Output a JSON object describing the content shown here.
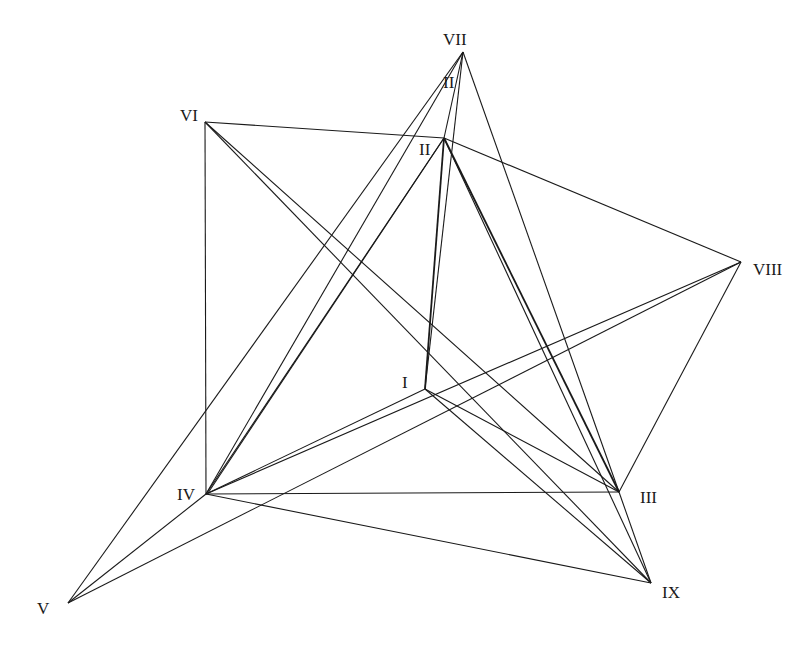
{
  "diagram": {
    "type": "line-drawing",
    "stroke_color": "#1a1a1a",
    "background": "#ffffff",
    "vertices": [
      {
        "id": "I",
        "label": "I",
        "x": 425,
        "y": 389,
        "label_x": 402,
        "label_y": 388
      },
      {
        "id": "II",
        "label": "II",
        "x": 444,
        "y": 138,
        "label_x": 419,
        "label_y": 155
      },
      {
        "id": "III",
        "label": "III",
        "x": 619,
        "y": 492,
        "label_x": 640,
        "label_y": 503
      },
      {
        "id": "IV",
        "label": "IV",
        "x": 206,
        "y": 494,
        "label_x": 177,
        "label_y": 500
      },
      {
        "id": "V",
        "label": "V",
        "x": 68,
        "y": 603,
        "label_x": 37,
        "label_y": 614
      },
      {
        "id": "VI",
        "label": "VI",
        "x": 205,
        "y": 122,
        "label_x": 180,
        "label_y": 121
      },
      {
        "id": "VII",
        "label": "VII",
        "x": 463,
        "y": 52,
        "label_x": 443,
        "label_y": 45
      },
      {
        "id": "VIII",
        "label": "VIII",
        "x": 741,
        "y": 262,
        "label_x": 753,
        "label_y": 275
      },
      {
        "id": "IX",
        "label": "IX",
        "x": 651,
        "y": 583,
        "label_x": 662,
        "label_y": 598
      }
    ],
    "extra_labels": [
      {
        "text": "II",
        "x": 443,
        "y": 88
      }
    ],
    "edges": [
      {
        "from": "VI",
        "to": "II"
      },
      {
        "from": "VI",
        "to": "IV"
      },
      {
        "from": "VI",
        "to": "III"
      },
      {
        "from": "VI",
        "to": "IX"
      },
      {
        "from": "II",
        "to": "VIII"
      },
      {
        "from": "II",
        "to": "III",
        "bold": true
      },
      {
        "from": "II",
        "to": "IX"
      },
      {
        "from": "II",
        "to": "I",
        "bold": true
      },
      {
        "from": "II",
        "to": "IV"
      },
      {
        "from": "II",
        "to": "IV2"
      },
      {
        "from": "VII",
        "to": "V"
      },
      {
        "from": "VII",
        "to": "IV"
      },
      {
        "from": "VII",
        "to": "III"
      },
      {
        "from": "VII",
        "to": "I"
      },
      {
        "from": "VII",
        "to": "II"
      },
      {
        "from": "VIII",
        "to": "III"
      },
      {
        "from": "VIII",
        "to": "IV"
      },
      {
        "from": "VIII",
        "to": "V"
      },
      {
        "from": "I",
        "to": "IV"
      },
      {
        "from": "I",
        "to": "III"
      },
      {
        "from": "IV",
        "to": "III"
      },
      {
        "from": "IV",
        "to": "IX"
      },
      {
        "from": "IV",
        "to": "V"
      },
      {
        "from": "III",
        "to": "IX"
      },
      {
        "from": "I",
        "to": "IX"
      }
    ]
  }
}
